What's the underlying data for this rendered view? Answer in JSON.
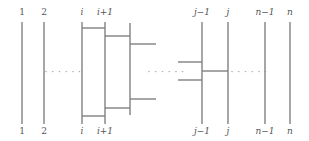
{
  "figure": {
    "width": 309,
    "height": 141,
    "background": "#ffffff",
    "stroke_color": "#808080",
    "label_color": "#555555",
    "ellipsis_color": "#8a8a8a",
    "stroke_width": 1.4
  },
  "strands": [
    {
      "id": "s1",
      "label": "1",
      "x": 22,
      "top_y": 22,
      "bottom_y": 124,
      "italic": false
    },
    {
      "id": "s2",
      "label": "2",
      "x": 44,
      "top_y": 22,
      "bottom_y": 124,
      "italic": false
    },
    {
      "id": "si",
      "label": "i",
      "x": 82,
      "top_y": 22,
      "bottom_y": 124,
      "italic": true
    },
    {
      "id": "si1",
      "label": "i+1",
      "x": 105,
      "top_y": 22,
      "bottom_y": 124,
      "italic": true
    },
    {
      "id": "sj1",
      "label": "j−1",
      "x": 202,
      "top_y": 22,
      "bottom_y": 124,
      "italic": true
    },
    {
      "id": "sj",
      "label": "j",
      "x": 228,
      "top_y": 22,
      "bottom_y": 124,
      "italic": true
    },
    {
      "id": "sn1",
      "label": "n−1",
      "x": 265,
      "top_y": 22,
      "bottom_y": 124,
      "italic": true
    },
    {
      "id": "sn",
      "label": "n",
      "x": 290,
      "top_y": 22,
      "bottom_y": 124,
      "italic": true
    }
  ],
  "top_labels": [
    {
      "text": "1",
      "x": 22,
      "y": 8,
      "italic": false
    },
    {
      "text": "2",
      "x": 44,
      "y": 8,
      "italic": false
    },
    {
      "text": "i",
      "x": 82,
      "y": 8,
      "italic": true
    },
    {
      "text": "i+1",
      "x": 105,
      "y": 8,
      "italic": true
    },
    {
      "text": "j−1",
      "x": 202,
      "y": 8,
      "italic": true
    },
    {
      "text": "j",
      "x": 228,
      "y": 8,
      "italic": true
    },
    {
      "text": "n−1",
      "x": 265,
      "y": 8,
      "italic": true
    },
    {
      "text": "n",
      "x": 290,
      "y": 8,
      "italic": true
    }
  ],
  "bottom_labels": [
    {
      "text": "1",
      "x": 22,
      "y": 127,
      "italic": false
    },
    {
      "text": "2",
      "x": 44,
      "y": 127,
      "italic": false
    },
    {
      "text": "i",
      "x": 82,
      "y": 127,
      "italic": true
    },
    {
      "text": "i+1",
      "x": 105,
      "y": 127,
      "italic": true
    },
    {
      "text": "j−1",
      "x": 202,
      "y": 127,
      "italic": true
    },
    {
      "text": "j",
      "x": 228,
      "y": 127,
      "italic": true
    },
    {
      "text": "n−1",
      "x": 265,
      "y": 127,
      "italic": true
    },
    {
      "text": "n",
      "x": 290,
      "y": 127,
      "italic": true
    }
  ],
  "ellipses": [
    {
      "id": "e1",
      "text": "· · · · · ·",
      "x": 63,
      "y": 68
    },
    {
      "id": "e2",
      "text": "· · · · · ·",
      "x": 166,
      "y": 68
    },
    {
      "id": "e3",
      "text": "· · · · · ·",
      "x": 249,
      "y": 68
    }
  ],
  "extra_verticals": [
    {
      "id": "v-mid-i",
      "x": 130,
      "top_y": 23,
      "bottom_y": 115
    }
  ],
  "connectors": [
    {
      "id": "h-i-top",
      "x1": 82,
      "x2": 105,
      "y": 28
    },
    {
      "id": "h-i1-top",
      "x1": 105,
      "x2": 130,
      "y": 36
    },
    {
      "id": "h-stub-top",
      "x1": 130,
      "x2": 156,
      "y": 44
    },
    {
      "id": "h-stub-bottom",
      "x1": 130,
      "x2": 156,
      "y": 99
    },
    {
      "id": "h-i1-bottom",
      "x1": 105,
      "x2": 130,
      "y": 108
    },
    {
      "id": "h-i-bottom",
      "x1": 82,
      "x2": 105,
      "y": 116
    },
    {
      "id": "h-j-stub-upper",
      "x1": 178,
      "x2": 202,
      "y": 62
    },
    {
      "id": "h-j-cross",
      "x1": 202,
      "x2": 228,
      "y": 71
    },
    {
      "id": "h-j-stub-lower",
      "x1": 178,
      "x2": 202,
      "y": 80
    }
  ],
  "legend": {
    "description": "Braid / tangle diagram with n strands; crossings drawn at positions i, i+1 and j−1, j"
  }
}
